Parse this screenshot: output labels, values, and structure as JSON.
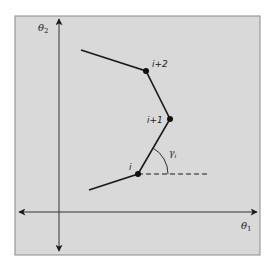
{
  "colors": {
    "background": "#ffffff",
    "panel": "#d9d9d9",
    "frame": "#8a8a8a",
    "ink": "#1a1a1a"
  },
  "axes": {
    "x_label": "θ",
    "x_sub": "1",
    "y_label": "θ",
    "y_sub": "2"
  },
  "points": [
    {
      "label": "i+2"
    },
    {
      "label": "i+1"
    },
    {
      "label": "i"
    }
  ],
  "angle": {
    "label": "γ",
    "sub": "i"
  }
}
